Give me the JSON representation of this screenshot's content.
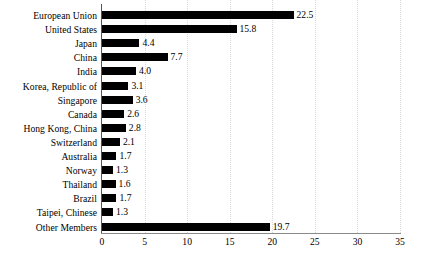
{
  "chart_data": {
    "type": "bar",
    "orientation": "horizontal",
    "title": "",
    "subtitle": "",
    "xlabel": "",
    "ylabel": "",
    "xlim": [
      0,
      35
    ],
    "xticks": [
      0,
      5,
      10,
      15,
      20,
      25,
      30,
      35
    ],
    "xtick_labels": [
      "0",
      "5",
      "10",
      "15",
      "20",
      "25",
      "30",
      "35"
    ],
    "grid": "vertical-dotted",
    "legend": "none",
    "bar_color": "#000000",
    "categories": [
      "European Union",
      "United States",
      "Japan",
      "China",
      "India",
      "Korea, Republic of",
      "Singapore",
      "Canada",
      "Hong Kong, China",
      "Switzerland",
      "Australia",
      "Norway",
      "Thailand",
      "Brazil",
      "Taipei, Chinese",
      "Other Members"
    ],
    "values": [
      22.5,
      15.8,
      4.4,
      7.7,
      4.0,
      3.1,
      3.6,
      2.6,
      2.8,
      2.1,
      1.7,
      1.3,
      1.6,
      1.7,
      1.3,
      19.7
    ],
    "value_labels": [
      "22.5",
      "15.8",
      "4.4",
      "7.7",
      "4.0",
      "3.1",
      "3.6",
      "2.6",
      "2.8",
      "2.1",
      "1.7",
      "1.3",
      "1.6",
      "1.7",
      "1.3",
      "19.7"
    ]
  }
}
